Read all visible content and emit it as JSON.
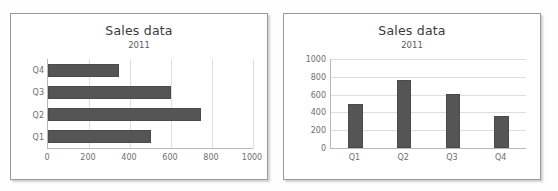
{
  "page": {
    "background_color": "#fefefe"
  },
  "panels": [
    {
      "name": "left-panel",
      "border_color": "#9a9a9a"
    },
    {
      "name": "right-panel",
      "border_color": "#9a9a9a"
    }
  ],
  "chart_data": [
    {
      "type": "bar",
      "orientation": "horizontal",
      "title": "Sales data",
      "subtitle": "2011",
      "xlabel": "",
      "ylabel": "",
      "categories": [
        "Q1",
        "Q2",
        "Q3",
        "Q4"
      ],
      "values": [
        500,
        745,
        600,
        345
      ],
      "category_order_top_to_bottom": [
        "Q4",
        "Q3",
        "Q2",
        "Q1"
      ],
      "xlim": [
        0,
        1000
      ],
      "xticks": [
        0,
        200,
        400,
        600,
        800,
        1000
      ],
      "xtick_labels": [
        "0",
        "200",
        "400",
        "600",
        "800",
        "1000"
      ],
      "grid": "vertical",
      "legend": "none",
      "bar_color": "#555555"
    },
    {
      "type": "bar",
      "orientation": "vertical",
      "title": "Sales data",
      "subtitle": "2011",
      "xlabel": "",
      "ylabel": "",
      "categories": [
        "Q1",
        "Q2",
        "Q3",
        "Q4"
      ],
      "values": [
        500,
        760,
        610,
        360
      ],
      "ylim": [
        0,
        1000
      ],
      "yticks": [
        0,
        200,
        400,
        600,
        800,
        1000
      ],
      "ytick_labels": [
        "0",
        "200",
        "400",
        "600",
        "800",
        "1000"
      ],
      "grid": "horizontal",
      "legend": "none",
      "bar_color": "#555555"
    }
  ]
}
